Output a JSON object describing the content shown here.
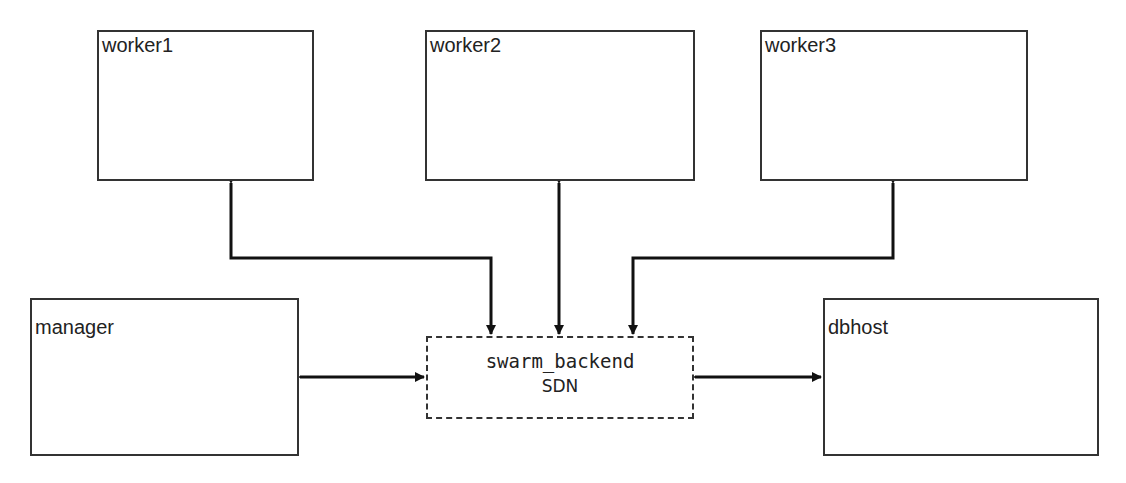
{
  "diagram": {
    "nodes": {
      "worker1": "worker1",
      "worker2": "worker2",
      "worker3": "worker3",
      "manager": "manager",
      "dbhost": "dbhost"
    },
    "network": {
      "name": "swarm_backend",
      "type": "SDN"
    },
    "edges": [
      {
        "from": "swarm_backend",
        "to": "worker1",
        "direction": "both"
      },
      {
        "from": "swarm_backend",
        "to": "worker2",
        "direction": "both"
      },
      {
        "from": "swarm_backend",
        "to": "worker3",
        "direction": "both"
      },
      {
        "from": "swarm_backend",
        "to": "manager",
        "direction": "both"
      },
      {
        "from": "swarm_backend",
        "to": "dbhost",
        "direction": "both"
      }
    ]
  }
}
